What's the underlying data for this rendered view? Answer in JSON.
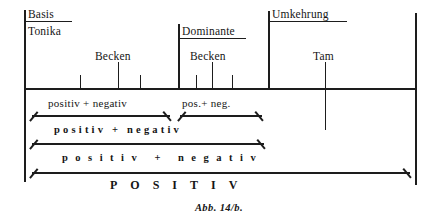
{
  "figure": {
    "caption": "Abb. 14/b.",
    "ink_color": "#1d1d1d",
    "background_color": "#ffffff"
  },
  "headers": [
    {
      "id": "basis",
      "label": "Basis",
      "x": 28,
      "y": 8
    },
    {
      "id": "tonika",
      "label": "Tonika",
      "x": 28,
      "y": 26
    },
    {
      "id": "dominante",
      "label": "Dominante",
      "x": 182,
      "y": 26
    },
    {
      "id": "umkehrung",
      "label": "Umkehrung",
      "x": 272,
      "y": 8
    }
  ],
  "marker_labels": [
    {
      "id": "becken-left",
      "label": "Becken",
      "x": 95,
      "y": 50
    },
    {
      "id": "becken-right",
      "label": "Becken",
      "x": 190,
      "y": 50
    },
    {
      "id": "tam",
      "label": "Tam",
      "x": 313,
      "y": 50
    }
  ],
  "bands": [
    {
      "id": "band-1",
      "segments": [
        {
          "id": "band-1-seg-1",
          "text": "positiv    + negativ"
        },
        {
          "id": "band-1-seg-2",
          "text": "pos.+   neg."
        }
      ]
    },
    {
      "id": "band-2",
      "segments": [
        {
          "id": "band-2-seg-1",
          "text": "positiv + negativ"
        }
      ]
    },
    {
      "id": "band-3",
      "segments": [
        {
          "id": "band-3-seg-1",
          "text": "positiv + negativ"
        }
      ]
    },
    {
      "id": "band-4",
      "segments": [
        {
          "id": "band-4-seg-1",
          "text": "POSITIV"
        }
      ]
    }
  ],
  "axis": {
    "baseline_y": 88,
    "left_x": 24,
    "right_x": 415,
    "ticks": [
      {
        "id": "tick-1",
        "x": 80,
        "height": "short"
      },
      {
        "id": "tick-2",
        "x": 118,
        "height": "tall"
      },
      {
        "id": "tick-3",
        "x": 140,
        "height": "short"
      },
      {
        "id": "tick-4",
        "x": 178,
        "height": "tall"
      },
      {
        "id": "tick-5",
        "x": 196,
        "height": "short"
      },
      {
        "id": "tick-6",
        "x": 212,
        "height": "tall"
      },
      {
        "id": "tick-7",
        "x": 232,
        "height": "short"
      },
      {
        "id": "tick-8",
        "x": 268,
        "height": "tall"
      },
      {
        "id": "tick-9",
        "x": 325,
        "height": "tall"
      }
    ]
  }
}
